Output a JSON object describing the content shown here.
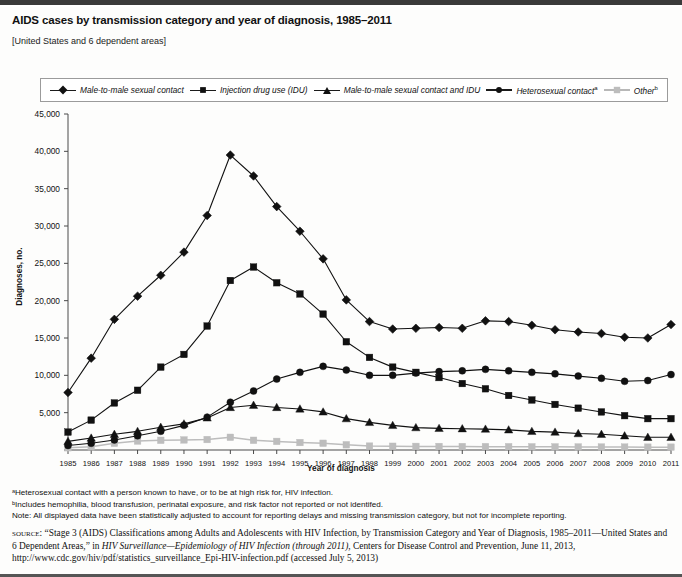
{
  "header": {
    "title": "AIDS cases by transmission category and year of diagnosis, 1985–2011",
    "subtitle": "[United States and 6 dependent areas]"
  },
  "notes": {
    "footnote_a": "ᵃHeterosexual contact with a person known to have, or to be at high risk for, HIV infection.",
    "footnote_b": "ᵇIncludes hemophilia, blood transfusion, perinatal exposure, and risk factor not reported or not identifed.",
    "note": "Note: All displayed data have been statistically adjusted to account for reporting delays and missing transmission category, but not for incomplete reporting.",
    "source_label": "source:",
    "source_part1": "“Stage 3 (AIDS) Classifications among Adults and Adolescents with HIV Infection, by Transmission Category and Year of Diagnosis, 1985–2011—United States and 6 Dependent Areas,” in ",
    "source_italic": "HIV Surveillance—Epidemiology of HIV Infection (through 2011)",
    "source_part2": ", Centers for Disease Control and Prevention, June 11, 2013, http://www.cdc.gov/hiv/pdf/statistics_surveillance_Epi-HIV-infection.pdf (accessed July 5, 2013)"
  },
  "legend": {
    "items": [
      {
        "label": "Male-to-male sexual contact",
        "marker": "diamond",
        "color": "#111111",
        "sup": ""
      },
      {
        "label": "Injection drug use (IDU)",
        "marker": "square",
        "color": "#111111",
        "sup": ""
      },
      {
        "label": "Male-to-male sexual contact and IDU",
        "marker": "triangle",
        "color": "#111111",
        "sup": ""
      },
      {
        "label": "Heterosexual contact",
        "marker": "circle",
        "color": "#111111",
        "sup": "a"
      },
      {
        "label": "Other",
        "marker": "square-gray",
        "color": "#bdbdbd",
        "sup": "b"
      }
    ]
  },
  "chart_data": {
    "type": "line",
    "title": "AIDS cases by transmission category and year of diagnosis, 1985–2011",
    "xlabel": "Year of diagnosis",
    "ylabel": "Diagnoses, no.",
    "ylim": [
      0,
      45000
    ],
    "ytick_step": 5000,
    "ytick_labels": [
      "0",
      "5,000",
      "10,000",
      "15,000",
      "20,000",
      "25,000",
      "30,000",
      "35,000",
      "40,000",
      "45,000"
    ],
    "grid": false,
    "legend_position": "top",
    "categories": [
      1985,
      1986,
      1987,
      1988,
      1989,
      1990,
      1991,
      1992,
      1993,
      1994,
      1995,
      1996,
      1997,
      1998,
      1999,
      2000,
      2001,
      2002,
      2003,
      2004,
      2005,
      2006,
      2007,
      2008,
      2009,
      2010,
      2011
    ],
    "series": [
      {
        "name": "Male-to-male sexual contact",
        "marker": "diamond",
        "color": "#111111",
        "values": [
          7700,
          12300,
          17500,
          20600,
          23400,
          26500,
          31400,
          39500,
          36700,
          32600,
          29300,
          25600,
          20100,
          17200,
          16200,
          16300,
          16400,
          16300,
          17300,
          17200,
          16700,
          16100,
          15800,
          15600,
          15100,
          15000,
          16800
        ]
      },
      {
        "name": "Injection drug use (IDU)",
        "marker": "square",
        "color": "#111111",
        "values": [
          2400,
          4000,
          6300,
          8000,
          11100,
          12800,
          16600,
          22700,
          24500,
          22400,
          20900,
          18200,
          14500,
          12400,
          11100,
          10400,
          9700,
          8900,
          8200,
          7300,
          6700,
          6100,
          5600,
          5100,
          4600,
          4200,
          4200
        ]
      },
      {
        "name": "Male-to-male sexual contact and IDU",
        "marker": "triangle",
        "color": "#111111",
        "values": [
          1150,
          1600,
          2100,
          2500,
          3050,
          3500,
          4300,
          5700,
          6000,
          5700,
          5500,
          5100,
          4200,
          3700,
          3300,
          3000,
          2900,
          2850,
          2800,
          2700,
          2500,
          2400,
          2200,
          2100,
          1900,
          1700,
          1700
        ]
      },
      {
        "name": "Heterosexual contact",
        "marker": "circle",
        "color": "#111111",
        "values": [
          600,
          900,
          1350,
          1900,
          2500,
          3300,
          4400,
          6400,
          7900,
          9500,
          10400,
          11200,
          10700,
          10000,
          10000,
          10300,
          10500,
          10600,
          10800,
          10600,
          10400,
          10200,
          9900,
          9600,
          9200,
          9300,
          10100
        ]
      },
      {
        "name": "Other",
        "marker": "square",
        "color": "#bdbdbd",
        "values": [
          300,
          420,
          900,
          1200,
          1300,
          1350,
          1400,
          1700,
          1300,
          1150,
          1000,
          900,
          700,
          520,
          500,
          480,
          470,
          460,
          450,
          440,
          430,
          420,
          410,
          400,
          390,
          380,
          380
        ]
      }
    ]
  }
}
